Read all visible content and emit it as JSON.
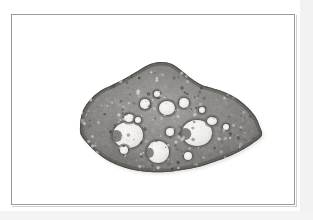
{
  "plate": {
    "background_color": "#ffffff",
    "frame": {
      "border_color": "#9a9a9a",
      "shadow_color": "#cfcfcf",
      "x": 11,
      "y": 14,
      "width": 284,
      "height": 191
    },
    "caption": "",
    "label": ""
  },
  "micrograph": {
    "name": "ovary-cross-section",
    "modality": "light-microscopy",
    "stain_tone": "grayscale",
    "description": "Transverse histological section of an ovary showing numerous ovarian follicles of varying size embedded in a dense stroma.",
    "specimen_shape": "elongate oval tapering to a point at the right",
    "colors": {
      "stroma_dark": "#5c5a58",
      "stroma_mid": "#7b7875",
      "stroma_light": "#9d9a96",
      "cortex_edge": "#46443f",
      "follicle_lumen": "#f4f3f0",
      "follicle_rim": "#6b6865",
      "background": "#ffffff"
    },
    "geometry": {
      "outline_points": "68,112 70,98 77,86 88,76 100,70 112,64 124,57 136,50 148,47 160,49 170,56 180,64 190,70 200,73 212,77 224,83 234,91 243,101 248,112 250,120 244,126 232,134 218,141 202,147 186,152 170,155 154,157 138,157 122,155 108,151 95,145 84,137 75,128 69,120",
      "cx": 158,
      "cy": 106
    },
    "follicles": [
      {
        "id": "follicle-large-left",
        "cx": 116,
        "cy": 120,
        "rx": 15,
        "ry": 13,
        "type": "antral",
        "lumen": true
      },
      {
        "id": "follicle-large-right",
        "cx": 185,
        "cy": 118,
        "rx": 15,
        "ry": 13,
        "type": "antral",
        "lumen": true
      },
      {
        "id": "follicle-large-bottom",
        "cx": 146,
        "cy": 137,
        "rx": 11,
        "ry": 11,
        "type": "antral",
        "lumen": true
      },
      {
        "id": "follicle-medium-top",
        "cx": 155,
        "cy": 93,
        "rx": 8,
        "ry": 7,
        "type": "secondary",
        "lumen": true
      },
      {
        "id": "follicle-medium-upper-right",
        "cx": 172,
        "cy": 88,
        "rx": 5,
        "ry": 5,
        "type": "secondary",
        "lumen": true
      },
      {
        "id": "follicle-medium-upper-left",
        "cx": 133,
        "cy": 89,
        "rx": 5,
        "ry": 5,
        "type": "secondary",
        "lumen": true
      },
      {
        "id": "follicle-small-left-rim",
        "cx": 117,
        "cy": 103,
        "rx": 5,
        "ry": 4,
        "type": "primary",
        "lumen": true
      },
      {
        "id": "follicle-small-right-rim",
        "cx": 200,
        "cy": 106,
        "rx": 5,
        "ry": 4,
        "type": "primary",
        "lumen": true
      },
      {
        "id": "follicle-small-lower-left",
        "cx": 112,
        "cy": 135,
        "rx": 4,
        "ry": 4,
        "type": "primary",
        "lumen": true
      },
      {
        "id": "follicle-small-center",
        "cx": 158,
        "cy": 117,
        "rx": 4,
        "ry": 4,
        "type": "primary",
        "lumen": true
      },
      {
        "id": "follicle-small-upper-mid",
        "cx": 145,
        "cy": 79,
        "rx": 3,
        "ry": 3,
        "type": "primordial",
        "lumen": true
      },
      {
        "id": "follicle-small-right-outer",
        "cx": 214,
        "cy": 112,
        "rx": 3,
        "ry": 3,
        "type": "primordial",
        "lumen": true
      },
      {
        "id": "follicle-small-bottom-right",
        "cx": 176,
        "cy": 141,
        "rx": 4,
        "ry": 4,
        "type": "primary",
        "lumen": true
      },
      {
        "id": "follicle-small-top-right",
        "cx": 190,
        "cy": 95,
        "rx": 3,
        "ry": 3,
        "type": "primordial",
        "lumen": true
      },
      {
        "id": "follicle-small-left-upper",
        "cx": 126,
        "cy": 105,
        "rx": 3,
        "ry": 3,
        "type": "primordial",
        "lumen": true
      }
    ],
    "speckle_count": 260
  }
}
